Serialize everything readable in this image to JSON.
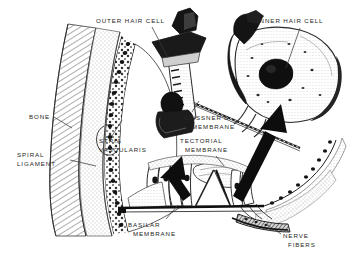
{
  "figure": {
    "background_color": "#ffffff",
    "ink_color": "#1a1a1a",
    "label_color": "#262626",
    "width": 352,
    "height": 261
  },
  "labels": {
    "outer_hair_cell": {
      "line1": "OUTER HAIR CELL"
    },
    "inner_hair_cell": {
      "line1": "INNER HAIR CELL"
    },
    "bone": {
      "line1": "BONE"
    },
    "stria_vascularis": {
      "line1": "STRIA",
      "line2": "VASCULARIS"
    },
    "spiral_ligament": {
      "line1": "SPIRAL",
      "line2": "LIGAMENT"
    },
    "reissners_membrane": {
      "line1": "REISSNER'S",
      "line2": "MEMBRANE"
    },
    "tectorial_membrane": {
      "line1": "TECTORIAL",
      "line2": "MEMBRANE"
    },
    "basilar_membrane": {
      "line1": "BASILAR",
      "line2": "MEMBRANE"
    },
    "nerve_fibers": {
      "line1": "NERVE",
      "line2": "FIBERS"
    }
  },
  "structures": [
    {
      "name": "bone",
      "description": "hatched bony wall along the left margin"
    },
    {
      "name": "spiral-ligament",
      "description": "stippled wedge between bone and stria vascularis"
    },
    {
      "name": "stria-vascularis",
      "description": "curved cellular band lining the lateral wall of the cochlear duct"
    },
    {
      "name": "reissners-membrane",
      "description": "thin dashed membrane crossing the scala media obliquely"
    },
    {
      "name": "tectorial-membrane",
      "description": "flap overhanging the hair cells"
    },
    {
      "name": "basilar-membrane",
      "description": "heavy horizontal line beneath the organ of Corti"
    },
    {
      "name": "organ-of-corti",
      "description": "cluster of supporting and hair cells on the basilar membrane"
    },
    {
      "name": "nerve-fibers",
      "description": "shaded bundle running beneath the basilar membrane at lower right"
    },
    {
      "name": "outer-hair-cell-inset",
      "description": "enlarged outer hair cell drawing at top center"
    },
    {
      "name": "inner-hair-cell-inset",
      "description": "enlarged inner hair cell drawing at top right"
    }
  ],
  "callouts": [
    {
      "name": "arrow-to-outer-hair-cell-inset",
      "style": "thick black arrow",
      "from": "organ of Corti outer hair cell",
      "to": "outer hair cell inset"
    },
    {
      "name": "arrow-to-inner-hair-cell-inset",
      "style": "thick black arrow",
      "from": "organ of Corti inner hair cell",
      "to": "inner hair cell inset"
    }
  ]
}
